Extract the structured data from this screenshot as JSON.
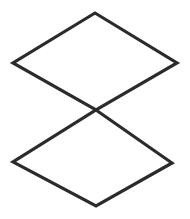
{
  "canvas": {
    "width": 190,
    "height": 219,
    "background_color": "#ffffff",
    "title": "two-overlapping-diamonds"
  },
  "style": {
    "stroke_color": "#2b2b2b",
    "stroke_width": 3.2,
    "fill_color": "none"
  },
  "figure": {
    "shape_count": 2,
    "shapes": [
      {
        "name": "top-diamond",
        "type": "quadrilateral",
        "points": "95,13 177,63 96,110 13,63",
        "vertices": [
          {
            "label": "apex",
            "x": 95,
            "y": 13
          },
          {
            "label": "right",
            "x": 177,
            "y": 63
          },
          {
            "label": "bottom-center",
            "x": 96,
            "y": 110
          },
          {
            "label": "left",
            "x": 13,
            "y": 63
          }
        ]
      },
      {
        "name": "bottom-diamond",
        "type": "quadrilateral",
        "points": "96,110 172,163 96,206 13,162",
        "vertices": [
          {
            "label": "top-center",
            "x": 96,
            "y": 110
          },
          {
            "label": "right",
            "x": 172,
            "y": 163
          },
          {
            "label": "apex",
            "x": 96,
            "y": 206
          },
          {
            "label": "left",
            "x": 13,
            "y": 162
          }
        ]
      }
    ],
    "crossing_point": {
      "x": 96,
      "y": 110
    }
  }
}
